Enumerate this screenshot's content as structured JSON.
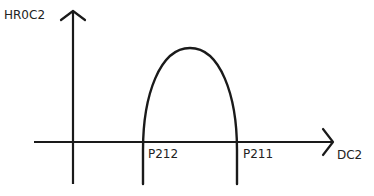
{
  "diagram": {
    "y_axis_label": "HR0C2",
    "x_axis_label": "DC2",
    "curve": "inverted parabola (arch) crossing the horizontal axis at two points",
    "points": [
      {
        "label": "P212"
      },
      {
        "label": "P211"
      }
    ],
    "colors": {
      "line": "#1a1a1a",
      "background": "#ffffff"
    }
  }
}
